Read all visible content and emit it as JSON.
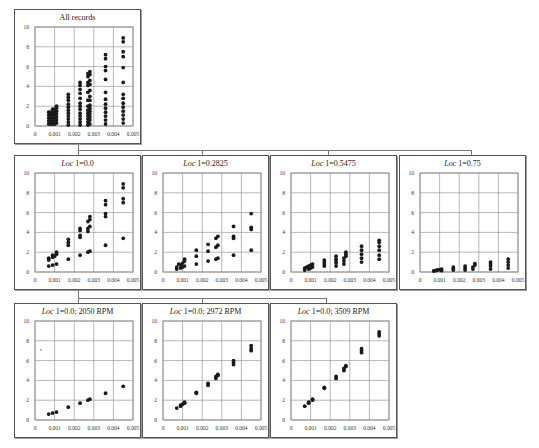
{
  "chart_data": [
    {
      "id": "all",
      "type": "scatter",
      "title": "All records",
      "title_italic_prefix": "",
      "xlim": [
        0,
        0.005
      ],
      "ylim": [
        0,
        10
      ],
      "xticks": [
        "0",
        "0.001",
        "0.002",
        "0.003",
        "0.004",
        "0.005"
      ],
      "yticks": [
        "0",
        "2",
        "4",
        "6",
        "8",
        "10"
      ],
      "grid": true,
      "points": [
        [
          0.0007,
          0.2
        ],
        [
          0.0007,
          0.5
        ],
        [
          0.0007,
          0.8
        ],
        [
          0.0007,
          1.1
        ],
        [
          0.0007,
          1.4
        ],
        [
          0.0008,
          0.2
        ],
        [
          0.0008,
          0.5
        ],
        [
          0.0008,
          0.8
        ],
        [
          0.0008,
          1.1
        ],
        [
          0.0008,
          1.4
        ],
        [
          0.0009,
          0.2
        ],
        [
          0.0009,
          0.5
        ],
        [
          0.0009,
          0.8
        ],
        [
          0.0009,
          1.1
        ],
        [
          0.0009,
          1.4
        ],
        [
          0.0009,
          1.7
        ],
        [
          0.001,
          0.2
        ],
        [
          0.001,
          0.5
        ],
        [
          0.001,
          0.8
        ],
        [
          0.001,
          1.1
        ],
        [
          0.001,
          1.4
        ],
        [
          0.001,
          1.7
        ],
        [
          0.0011,
          0.3
        ],
        [
          0.0011,
          0.6
        ],
        [
          0.0011,
          0.9
        ],
        [
          0.0011,
          1.2
        ],
        [
          0.0011,
          1.5
        ],
        [
          0.0011,
          1.8
        ],
        [
          0.0011,
          2.0
        ],
        [
          0.0017,
          0.1
        ],
        [
          0.0017,
          0.4
        ],
        [
          0.0017,
          0.7
        ],
        [
          0.0017,
          1.0
        ],
        [
          0.0017,
          1.3
        ],
        [
          0.0017,
          1.6
        ],
        [
          0.0017,
          1.9
        ],
        [
          0.0017,
          2.2
        ],
        [
          0.0017,
          2.6
        ],
        [
          0.0017,
          2.9
        ],
        [
          0.0017,
          3.2
        ],
        [
          0.0023,
          0.1
        ],
        [
          0.0023,
          0.4
        ],
        [
          0.0023,
          0.7
        ],
        [
          0.0023,
          1.0
        ],
        [
          0.0023,
          1.3
        ],
        [
          0.0023,
          1.7
        ],
        [
          0.0023,
          2.0
        ],
        [
          0.0023,
          2.3
        ],
        [
          0.0023,
          2.8
        ],
        [
          0.0023,
          3.3
        ],
        [
          0.0023,
          3.7
        ],
        [
          0.0023,
          4.1
        ],
        [
          0.0023,
          4.4
        ],
        [
          0.0027,
          0.1
        ],
        [
          0.0027,
          0.4
        ],
        [
          0.0027,
          0.7
        ],
        [
          0.0027,
          1.0
        ],
        [
          0.0027,
          1.3
        ],
        [
          0.0027,
          1.6
        ],
        [
          0.0027,
          2.0
        ],
        [
          0.0027,
          2.6
        ],
        [
          0.0027,
          3.4
        ],
        [
          0.0027,
          4.1
        ],
        [
          0.0027,
          4.4
        ],
        [
          0.0027,
          5.0
        ],
        [
          0.0027,
          5.3
        ],
        [
          0.0028,
          0.2
        ],
        [
          0.0028,
          0.6
        ],
        [
          0.0028,
          0.9
        ],
        [
          0.0028,
          1.2
        ],
        [
          0.0028,
          1.5
        ],
        [
          0.0028,
          1.8
        ],
        [
          0.0028,
          2.1
        ],
        [
          0.0028,
          2.6
        ],
        [
          0.0028,
          3.0
        ],
        [
          0.0028,
          3.6
        ],
        [
          0.0028,
          4.2
        ],
        [
          0.0028,
          4.6
        ],
        [
          0.0028,
          5.2
        ],
        [
          0.0028,
          5.5
        ],
        [
          0.0036,
          0.2
        ],
        [
          0.0036,
          0.6
        ],
        [
          0.0036,
          1.0
        ],
        [
          0.0036,
          1.4
        ],
        [
          0.0036,
          1.8
        ],
        [
          0.0036,
          2.2
        ],
        [
          0.0036,
          2.7
        ],
        [
          0.0036,
          3.4
        ],
        [
          0.0036,
          4.7
        ],
        [
          0.0036,
          5.6
        ],
        [
          0.0036,
          6.0
        ],
        [
          0.0036,
          6.8
        ],
        [
          0.0036,
          7.2
        ],
        [
          0.0045,
          0.3
        ],
        [
          0.0045,
          0.7
        ],
        [
          0.0045,
          1.1
        ],
        [
          0.0045,
          1.5
        ],
        [
          0.0045,
          1.9
        ],
        [
          0.0045,
          2.3
        ],
        [
          0.0045,
          2.8
        ],
        [
          0.0045,
          3.2
        ],
        [
          0.0045,
          4.4
        ],
        [
          0.0045,
          5.9
        ],
        [
          0.0045,
          7.0
        ],
        [
          0.0045,
          7.5
        ],
        [
          0.0045,
          8.5
        ],
        [
          0.0045,
          8.9
        ]
      ]
    },
    {
      "id": "loc0",
      "type": "scatter",
      "title": "1=0.0",
      "title_italic_prefix": "Loc",
      "xlim": [
        0,
        0.005
      ],
      "ylim": [
        0,
        10
      ],
      "xticks": [
        "0",
        "0.001",
        "0.002",
        "0.003",
        "0.004",
        "0.005"
      ],
      "yticks": [
        "0",
        "2",
        "4",
        "6",
        "8",
        "10"
      ],
      "grid": true,
      "points": [
        [
          0.0007,
          0.6
        ],
        [
          0.0009,
          0.7
        ],
        [
          0.0011,
          0.8
        ],
        [
          0.0007,
          1.2
        ],
        [
          0.0007,
          1.4
        ],
        [
          0.0009,
          1.5
        ],
        [
          0.0009,
          1.7
        ],
        [
          0.001,
          1.6
        ],
        [
          0.0011,
          1.8
        ],
        [
          0.0011,
          2.0
        ],
        [
          0.0017,
          1.3
        ],
        [
          0.0017,
          2.7
        ],
        [
          0.0017,
          3.0
        ],
        [
          0.0017,
          3.3
        ],
        [
          0.0023,
          1.7
        ],
        [
          0.0023,
          3.5
        ],
        [
          0.0023,
          3.7
        ],
        [
          0.0023,
          4.2
        ],
        [
          0.0023,
          4.4
        ],
        [
          0.0027,
          2.0
        ],
        [
          0.0028,
          2.1
        ],
        [
          0.0027,
          4.1
        ],
        [
          0.0027,
          4.4
        ],
        [
          0.0028,
          4.6
        ],
        [
          0.0027,
          5.1
        ],
        [
          0.0028,
          5.3
        ],
        [
          0.0028,
          5.6
        ],
        [
          0.0036,
          2.7
        ],
        [
          0.0036,
          5.6
        ],
        [
          0.0036,
          5.9
        ],
        [
          0.0036,
          6.8
        ],
        [
          0.0036,
          7.2
        ],
        [
          0.0045,
          3.4
        ],
        [
          0.0045,
          7.0
        ],
        [
          0.0045,
          7.4
        ],
        [
          0.0045,
          8.5
        ],
        [
          0.0045,
          8.9
        ]
      ]
    },
    {
      "id": "loc02825",
      "type": "scatter",
      "title": "1=0.2825",
      "title_italic_prefix": "Loc",
      "xlim": [
        0,
        0.005
      ],
      "ylim": [
        0,
        10
      ],
      "xticks": [
        "0",
        "0.001",
        "0.002",
        "0.003",
        "0.004",
        "0.005"
      ],
      "yticks": [
        "0",
        "2",
        "4",
        "6",
        "8",
        "10"
      ],
      "grid": true,
      "points": [
        [
          0.0007,
          0.3
        ],
        [
          0.0007,
          0.5
        ],
        [
          0.0008,
          0.8
        ],
        [
          0.0009,
          0.4
        ],
        [
          0.0009,
          0.7
        ],
        [
          0.001,
          0.9
        ],
        [
          0.001,
          0.5
        ],
        [
          0.0011,
          1.1
        ],
        [
          0.0011,
          1.3
        ],
        [
          0.0011,
          0.6
        ],
        [
          0.0017,
          0.8
        ],
        [
          0.0017,
          1.6
        ],
        [
          0.0017,
          2.2
        ],
        [
          0.0023,
          1.1
        ],
        [
          0.0023,
          2.1
        ],
        [
          0.0023,
          2.8
        ],
        [
          0.0027,
          1.3
        ],
        [
          0.0028,
          1.4
        ],
        [
          0.0027,
          2.5
        ],
        [
          0.0028,
          2.7
        ],
        [
          0.0027,
          3.4
        ],
        [
          0.0028,
          3.6
        ],
        [
          0.0036,
          1.7
        ],
        [
          0.0036,
          3.4
        ],
        [
          0.0036,
          3.6
        ],
        [
          0.0036,
          4.6
        ],
        [
          0.0045,
          2.2
        ],
        [
          0.0045,
          4.3
        ],
        [
          0.0045,
          4.5
        ],
        [
          0.0045,
          5.9
        ]
      ]
    },
    {
      "id": "loc05475",
      "type": "scatter",
      "title": "1=0.5475",
      "title_italic_prefix": "Loc",
      "xlim": [
        0,
        0.005
      ],
      "ylim": [
        0,
        10
      ],
      "xticks": [
        "0",
        "0.001",
        "0.002",
        "0.003",
        "0.004",
        "0.005"
      ],
      "yticks": [
        "0",
        "2",
        "4",
        "6",
        "8",
        "10"
      ],
      "grid": true,
      "points": [
        [
          0.0007,
          0.2
        ],
        [
          0.0007,
          0.4
        ],
        [
          0.0008,
          0.5
        ],
        [
          0.0009,
          0.3
        ],
        [
          0.0009,
          0.6
        ],
        [
          0.001,
          0.4
        ],
        [
          0.001,
          0.7
        ],
        [
          0.0011,
          0.5
        ],
        [
          0.0011,
          0.8
        ],
        [
          0.0017,
          0.6
        ],
        [
          0.0017,
          0.8
        ],
        [
          0.0017,
          1.0
        ],
        [
          0.0017,
          1.2
        ],
        [
          0.0023,
          0.6
        ],
        [
          0.0023,
          0.9
        ],
        [
          0.0023,
          1.1
        ],
        [
          0.0023,
          1.3
        ],
        [
          0.0023,
          1.6
        ],
        [
          0.0027,
          0.8
        ],
        [
          0.0027,
          1.1
        ],
        [
          0.0027,
          1.4
        ],
        [
          0.0028,
          1.6
        ],
        [
          0.0028,
          1.8
        ],
        [
          0.0028,
          2.0
        ],
        [
          0.0036,
          1.0
        ],
        [
          0.0036,
          1.4
        ],
        [
          0.0036,
          1.8
        ],
        [
          0.0036,
          2.2
        ],
        [
          0.0036,
          2.6
        ],
        [
          0.0045,
          1.3
        ],
        [
          0.0045,
          1.7
        ],
        [
          0.0045,
          2.2
        ],
        [
          0.0045,
          2.6
        ],
        [
          0.0045,
          3.0
        ],
        [
          0.0045,
          3.2
        ]
      ]
    },
    {
      "id": "loc075",
      "type": "scatter",
      "title": "1=0.75",
      "title_italic_prefix": "Loc",
      "xlim": [
        0,
        0.005
      ],
      "ylim": [
        0,
        10
      ],
      "xticks": [
        "0",
        "0.001",
        "0.002",
        "0.003",
        "0.004",
        "0.005"
      ],
      "yticks": [
        "0",
        "2",
        "4",
        "6",
        "8",
        "10"
      ],
      "grid": true,
      "points": [
        [
          0.0007,
          0.1
        ],
        [
          0.0008,
          0.15
        ],
        [
          0.0009,
          0.2
        ],
        [
          0.001,
          0.25
        ],
        [
          0.0011,
          0.3
        ],
        [
          0.0011,
          0.15
        ],
        [
          0.0017,
          0.2
        ],
        [
          0.0017,
          0.35
        ],
        [
          0.0017,
          0.5
        ],
        [
          0.0023,
          0.2
        ],
        [
          0.0023,
          0.4
        ],
        [
          0.0023,
          0.6
        ],
        [
          0.0027,
          0.3
        ],
        [
          0.0027,
          0.5
        ],
        [
          0.0028,
          0.7
        ],
        [
          0.0028,
          0.85
        ],
        [
          0.0036,
          0.3
        ],
        [
          0.0036,
          0.6
        ],
        [
          0.0036,
          0.8
        ],
        [
          0.0036,
          1.0
        ],
        [
          0.0045,
          0.4
        ],
        [
          0.0045,
          0.7
        ],
        [
          0.0045,
          1.0
        ],
        [
          0.0045,
          1.3
        ]
      ]
    },
    {
      "id": "loc0_2050",
      "type": "scatter",
      "title": "1=0.0; 2050 RPM",
      "title_italic_prefix": "Loc",
      "xlim": [
        0,
        0.005
      ],
      "ylim": [
        0,
        10
      ],
      "xticks": [
        "0",
        "0.001",
        "0.002",
        "0.003",
        "0.004",
        "0.005"
      ],
      "yticks": [
        "0",
        "2",
        "4",
        "6",
        "8",
        "10"
      ],
      "grid": true,
      "annotation": "r",
      "points": [
        [
          0.0007,
          0.6
        ],
        [
          0.0009,
          0.7
        ],
        [
          0.0011,
          0.8
        ],
        [
          0.0017,
          1.3
        ],
        [
          0.0023,
          1.7
        ],
        [
          0.0027,
          2.0
        ],
        [
          0.0028,
          2.1
        ],
        [
          0.0036,
          2.7
        ],
        [
          0.0045,
          3.4
        ]
      ]
    },
    {
      "id": "loc0_2972",
      "type": "scatter",
      "title": "1=0.0; 2972 RPM",
      "title_italic_prefix": "Loc",
      "xlim": [
        0,
        0.005
      ],
      "ylim": [
        0,
        10
      ],
      "xticks": [
        "0",
        "0.001",
        "0.002",
        "0.003",
        "0.004",
        "0.005"
      ],
      "yticks": [
        "0",
        "2",
        "4",
        "6",
        "8",
        "10"
      ],
      "grid": true,
      "points": [
        [
          0.0007,
          1.2
        ],
        [
          0.0009,
          1.4
        ],
        [
          0.0009,
          1.5
        ],
        [
          0.001,
          1.6
        ],
        [
          0.0011,
          1.7
        ],
        [
          0.0011,
          1.8
        ],
        [
          0.0017,
          2.7
        ],
        [
          0.0017,
          2.8
        ],
        [
          0.0023,
          3.5
        ],
        [
          0.0023,
          3.7
        ],
        [
          0.0027,
          4.2
        ],
        [
          0.0027,
          4.4
        ],
        [
          0.0028,
          4.5
        ],
        [
          0.0028,
          4.6
        ],
        [
          0.0036,
          5.6
        ],
        [
          0.0036,
          5.8
        ],
        [
          0.0036,
          6.0
        ],
        [
          0.0045,
          7.0
        ],
        [
          0.0045,
          7.2
        ],
        [
          0.0045,
          7.5
        ]
      ]
    },
    {
      "id": "loc0_3509",
      "type": "scatter",
      "title": "1=0.0; 3509 RPM",
      "title_italic_prefix": "Loc",
      "xlim": [
        0,
        0.005
      ],
      "ylim": [
        0,
        10
      ],
      "xticks": [
        "0",
        "0.001",
        "0.002",
        "0.003",
        "0.004",
        "0.005"
      ],
      "yticks": [
        "0",
        "2",
        "4",
        "6",
        "8",
        "10"
      ],
      "grid": true,
      "points": [
        [
          0.0007,
          1.4
        ],
        [
          0.0009,
          1.7
        ],
        [
          0.0009,
          1.8
        ],
        [
          0.0011,
          2.0
        ],
        [
          0.0011,
          2.1
        ],
        [
          0.0017,
          3.2
        ],
        [
          0.0017,
          3.3
        ],
        [
          0.0023,
          4.2
        ],
        [
          0.0023,
          4.4
        ],
        [
          0.0027,
          5.0
        ],
        [
          0.0027,
          5.2
        ],
        [
          0.0028,
          5.4
        ],
        [
          0.0028,
          5.5
        ],
        [
          0.0036,
          6.8
        ],
        [
          0.0036,
          7.0
        ],
        [
          0.0036,
          7.2
        ],
        [
          0.0045,
          8.5
        ],
        [
          0.0045,
          8.7
        ],
        [
          0.0045,
          8.9
        ]
      ]
    }
  ]
}
